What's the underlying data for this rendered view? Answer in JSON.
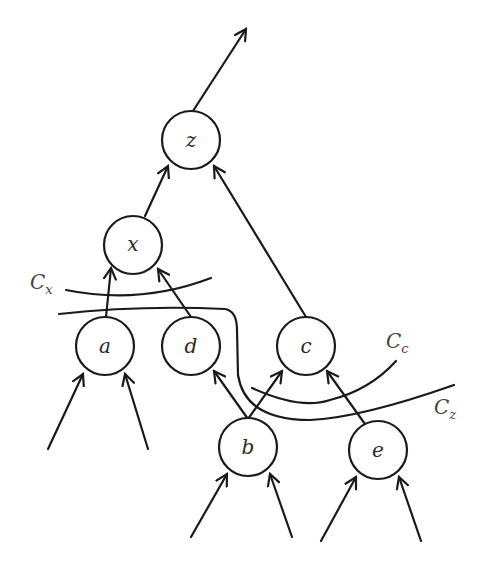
{
  "diagram": {
    "type": "tree-with-cuts",
    "nodes": [
      {
        "id": "z",
        "label": "z",
        "cx": 191,
        "cy": 140
      },
      {
        "id": "x",
        "label": "x",
        "cx": 133,
        "cy": 245
      },
      {
        "id": "a",
        "label": "a",
        "cx": 105,
        "cy": 346
      },
      {
        "id": "d",
        "label": "d",
        "cx": 191,
        "cy": 346
      },
      {
        "id": "c",
        "label": "c",
        "cx": 306,
        "cy": 346
      },
      {
        "id": "b",
        "label": "b",
        "cx": 248,
        "cy": 447
      },
      {
        "id": "e",
        "label": "e",
        "cx": 378,
        "cy": 450
      }
    ],
    "edges": [
      {
        "from": "z",
        "to": "output"
      },
      {
        "from": "x",
        "to": "z"
      },
      {
        "from": "c",
        "to": "z"
      },
      {
        "from": "a",
        "to": "x"
      },
      {
        "from": "d",
        "to": "x"
      },
      {
        "from": "b",
        "to": "d"
      },
      {
        "from": "b",
        "to": "c"
      },
      {
        "from": "e",
        "to": "c"
      },
      {
        "from": "input",
        "to": "a"
      },
      {
        "from": "input",
        "to": "a"
      },
      {
        "from": "input",
        "to": "b"
      },
      {
        "from": "input",
        "to": "b"
      },
      {
        "from": "input",
        "to": "e"
      },
      {
        "from": "input",
        "to": "e"
      }
    ],
    "cuts": [
      {
        "id": "Cx",
        "main": "C",
        "sub": "x"
      },
      {
        "id": "Cc",
        "main": "C",
        "sub": "c"
      },
      {
        "id": "Cz",
        "main": "C",
        "sub": "z"
      }
    ]
  }
}
